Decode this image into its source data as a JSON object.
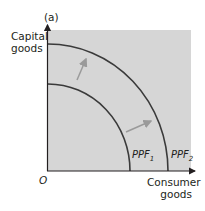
{
  "diagram": {
    "panel_label": "(a)",
    "y_axis_label_line1": "Capital",
    "y_axis_label_line2": "goods",
    "x_axis_label_line1": "Consumer",
    "x_axis_label_line2": "goods",
    "origin_label": "O",
    "curves": [
      {
        "name": "PPF",
        "subscript": "1"
      },
      {
        "name": "PPF",
        "subscript": "2"
      }
    ],
    "colors": {
      "background_panel": "#d6d6d6",
      "curve": "#3a3a3a",
      "arrow": "#9a9a9a",
      "axis": "#231f20"
    }
  }
}
